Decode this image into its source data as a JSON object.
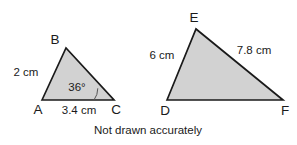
{
  "caption": "Not drawn accurately",
  "colors": {
    "fill": "#d2d2d2",
    "stroke": "#1a1a1a",
    "arc": "#555555",
    "background": "#ffffff"
  },
  "triangle_left": {
    "name": "triangle-abc",
    "vertices": [
      {
        "label": "A",
        "x": 42,
        "y": 100
      },
      {
        "label": "B",
        "x": 66,
        "y": 48
      },
      {
        "label": "C",
        "x": 114,
        "y": 100
      }
    ],
    "vertex_labels": {
      "a": "A",
      "b": "B",
      "c": "C"
    },
    "sides": {
      "ab": "2 cm",
      "ac": "3.4 cm"
    },
    "angle": {
      "at_vertex": "C",
      "value": "36°"
    }
  },
  "triangle_right": {
    "name": "triangle-def",
    "vertices": [
      {
        "label": "D",
        "x": 167,
        "y": 100
      },
      {
        "label": "E",
        "x": 196,
        "y": 29
      },
      {
        "label": "F",
        "x": 283,
        "y": 100
      }
    ],
    "vertex_labels": {
      "d": "D",
      "e": "E",
      "f": "F"
    },
    "sides": {
      "de": "6 cm",
      "ef": "7.8 cm"
    }
  }
}
